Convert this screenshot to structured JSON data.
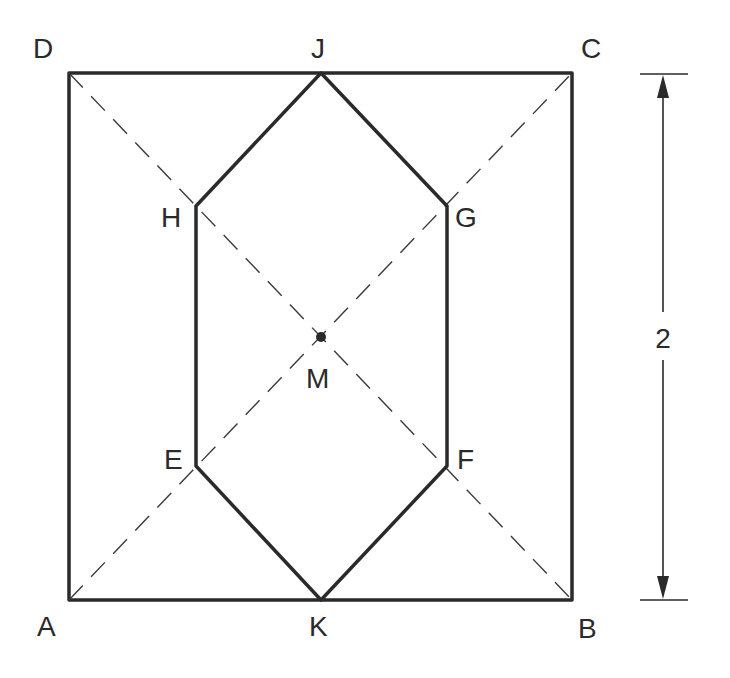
{
  "diagram": {
    "type": "geometry",
    "colors": {
      "stroke": "#2a2a2a",
      "background": "#ffffff"
    },
    "points": {
      "A": {
        "label": "A",
        "x": 69,
        "y": 600
      },
      "B": {
        "label": "B",
        "x": 572,
        "y": 600
      },
      "C": {
        "label": "C",
        "x": 572,
        "y": 73
      },
      "D": {
        "label": "D",
        "x": 69,
        "y": 73
      },
      "J": {
        "label": "J",
        "x": 321,
        "y": 73
      },
      "K": {
        "label": "K",
        "x": 321,
        "y": 600
      },
      "H": {
        "label": "H",
        "x": 196,
        "y": 206
      },
      "G": {
        "label": "G",
        "x": 447,
        "y": 206
      },
      "E": {
        "label": "E",
        "x": 196,
        "y": 466
      },
      "F": {
        "label": "F",
        "x": 447,
        "y": 466
      },
      "M": {
        "label": "M",
        "x": 321,
        "y": 337
      }
    },
    "square": [
      "A",
      "B",
      "C",
      "D"
    ],
    "hexagon": [
      "J",
      "G",
      "F",
      "K",
      "E",
      "H"
    ],
    "dashed_lines": [
      [
        "A",
        "C"
      ],
      [
        "D",
        "B"
      ]
    ],
    "center_point": "M",
    "dimension": {
      "label": "2",
      "side": "right",
      "spans": [
        "C",
        "B"
      ]
    }
  }
}
